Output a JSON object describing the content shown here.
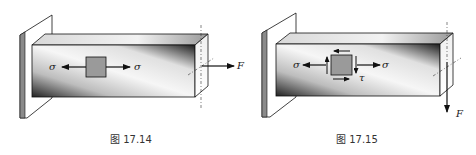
{
  "figures": [
    {
      "id": "fig-17-14",
      "caption": "图 17.14",
      "labels": {
        "sigma_left": "σ",
        "sigma_right": "σ",
        "force": "F"
      },
      "description": "Cantilever beam under axial tension F; stress element shows normal stress σ only"
    },
    {
      "id": "fig-17-15",
      "caption": "图 17.15",
      "labels": {
        "sigma_left": "σ",
        "sigma_right": "σ",
        "tau": "τ",
        "force": "F"
      },
      "description": "Cantilever beam under transverse load F; stress element shows normal stress σ and shear stress τ"
    }
  ],
  "colors": {
    "wall_side": "#8a8a8a",
    "wall_face": "#ffffff",
    "beam_dark": "#1a1a1a",
    "beam_light": "#f4f4f4",
    "element_fill": "#9a9a9a",
    "stroke": "#111111"
  }
}
